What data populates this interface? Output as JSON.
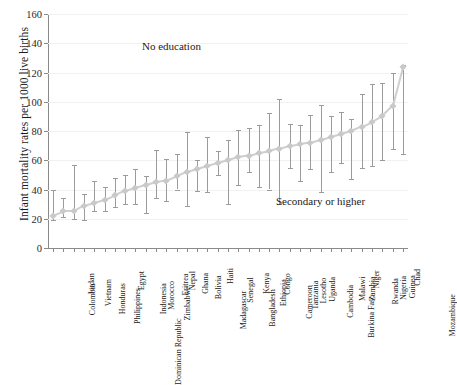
{
  "chart_data": {
    "type": "line",
    "title": "",
    "xlabel": "",
    "ylabel": "Infant mortality rates per 1000 live births",
    "ylim": [
      0,
      160
    ],
    "yticks": [
      0,
      20,
      40,
      60,
      80,
      100,
      120,
      140,
      160
    ],
    "grid": true,
    "legend_position": "none",
    "annotations": [
      {
        "text": "No education",
        "x_index": 11.5,
        "y": 138
      },
      {
        "text": "Secondary or higher",
        "x_index": 26.0,
        "y": 32
      }
    ],
    "categories": [
      "Colombia",
      "Jordan",
      "Vietnam",
      "Honduras",
      "Philippines",
      "Dominican Republic",
      "Egypt",
      "Indonesia",
      "Morocco",
      "Zimbabwe",
      "Eritrea",
      "Nepal",
      "Ghana",
      "Bolivia",
      "Madagascar",
      "Haiti",
      "Senegal",
      "Bangladesh",
      "Kenya",
      "Ethiopia",
      "Congo",
      "Cameroon",
      "Tanzania",
      "Lesotho",
      "Uganda",
      "Cambodia",
      "Burkina Faso",
      "Malawi",
      "Zambia",
      "Niger",
      "Rwanda",
      "Nigeria",
      "Guinea",
      "Chad",
      "Mozambique"
    ],
    "series": [
      {
        "name": "Infant mortality rate",
        "values": [
          22,
          25,
          25,
          29,
          31,
          33,
          36,
          39,
          41,
          43,
          45,
          46,
          49,
          52,
          54,
          56,
          58,
          60,
          62,
          63,
          65,
          66,
          68,
          70,
          71,
          72,
          74,
          76,
          78,
          80,
          83,
          86,
          90,
          97,
          124
        ],
        "error_low": [
          19,
          21,
          20,
          19,
          25,
          25,
          28,
          30,
          30,
          24,
          34,
          32,
          40,
          29,
          39,
          38,
          50,
          30,
          43,
          52,
          42,
          40,
          30,
          55,
          46,
          54,
          38,
          52,
          58,
          47,
          55,
          56,
          60,
          68,
          64
        ],
        "error_high": [
          40,
          34,
          57,
          37,
          46,
          42,
          48,
          50,
          54,
          49,
          67,
          61,
          64,
          79,
          60,
          76,
          66,
          74,
          81,
          82,
          84,
          92,
          102,
          85,
          84,
          91,
          98,
          90,
          93,
          88,
          105,
          112,
          113,
          120,
          125
        ]
      }
    ]
  }
}
